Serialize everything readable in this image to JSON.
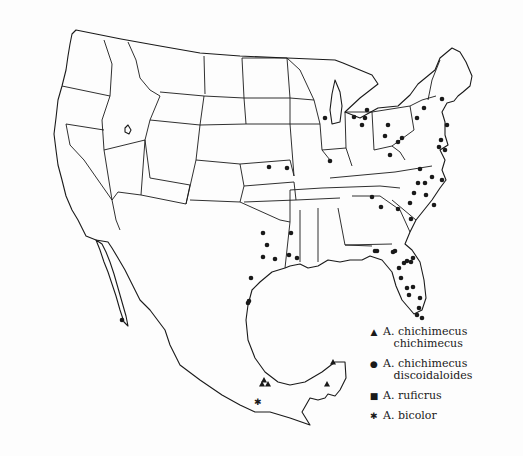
{
  "map": {
    "subject": "Distribution of Ammophila species in the United States and Mexico",
    "ink_color": "#1a1a1a",
    "background_color": "#fdfdfd"
  },
  "legend": {
    "items": [
      {
        "symbol": "triangle",
        "glyph": "▲",
        "label": "A. chichimecus\n   chichimecus"
      },
      {
        "symbol": "dot",
        "glyph": "●",
        "label": "A. chichimecus\n   discoidaloides"
      },
      {
        "symbol": "square",
        "glyph": "■",
        "label": "A. ruficrus"
      },
      {
        "symbol": "asterisk",
        "glyph": "✱",
        "label": "A. bicolor"
      }
    ]
  },
  "markers": {
    "triangle": [
      [
        262,
        384
      ],
      [
        268,
        384
      ],
      [
        264,
        380
      ],
      [
        333,
        362
      ],
      [
        327,
        384
      ]
    ],
    "asterisk": [
      [
        258,
        402
      ]
    ],
    "dot": [
      [
        325,
        118
      ],
      [
        354,
        117
      ],
      [
        365,
        118
      ],
      [
        367,
        110
      ],
      [
        362,
        125
      ],
      [
        388,
        125
      ],
      [
        385,
        136
      ],
      [
        402,
        138
      ],
      [
        390,
        155
      ],
      [
        398,
        142
      ],
      [
        417,
        118
      ],
      [
        424,
        108
      ],
      [
        442,
        99
      ],
      [
        447,
        125
      ],
      [
        441,
        140
      ],
      [
        439,
        147
      ],
      [
        445,
        150
      ],
      [
        420,
        169
      ],
      [
        418,
        183
      ],
      [
        330,
        161
      ],
      [
        269,
        167
      ],
      [
        287,
        168
      ],
      [
        372,
        197
      ],
      [
        381,
        207
      ],
      [
        434,
        205
      ],
      [
        426,
        195
      ],
      [
        414,
        193
      ],
      [
        425,
        183
      ],
      [
        410,
        203
      ],
      [
        398,
        209
      ],
      [
        411,
        219
      ],
      [
        432,
        177
      ],
      [
        442,
        180
      ],
      [
        291,
        233
      ],
      [
        289,
        255
      ],
      [
        263,
        233
      ],
      [
        267,
        245
      ],
      [
        263,
        257
      ],
      [
        275,
        259
      ],
      [
        251,
        278
      ],
      [
        248,
        303
      ],
      [
        297,
        258
      ],
      [
        377,
        251
      ],
      [
        393,
        252
      ],
      [
        395,
        251
      ],
      [
        407,
        261
      ],
      [
        413,
        258
      ],
      [
        399,
        268
      ],
      [
        404,
        263
      ],
      [
        411,
        262
      ],
      [
        401,
        278
      ],
      [
        407,
        288
      ],
      [
        413,
        287
      ],
      [
        409,
        295
      ],
      [
        420,
        298
      ],
      [
        419,
        308
      ],
      [
        417,
        315
      ],
      [
        422,
        318
      ],
      [
        375,
        251
      ],
      [
        122,
        320
      ],
      [
        249,
        301
      ]
    ]
  }
}
